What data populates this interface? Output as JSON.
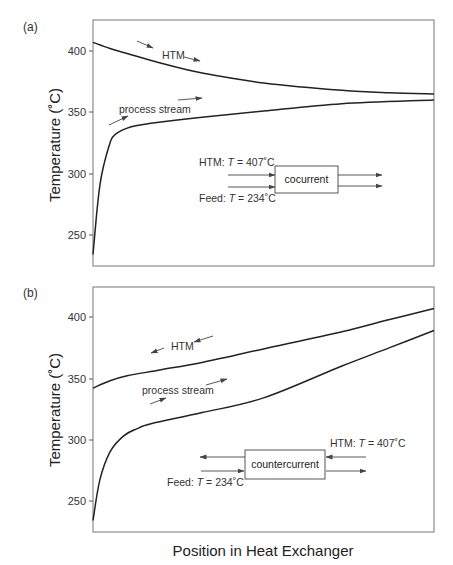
{
  "figure": {
    "xlabel": "Position in Heat Exchanger",
    "ylabel": "Temperature (°C)"
  },
  "chart_data": [
    {
      "type": "line",
      "panel": "(a)",
      "title": "",
      "xlabel": "",
      "ylabel": "Temperature (°C)",
      "ylim": [
        225,
        425
      ],
      "xlim": [
        0,
        1
      ],
      "yticks": [
        250,
        300,
        350,
        400
      ],
      "grid": false,
      "annotations": [
        "HTM",
        "process stream",
        "HTM: T = 407°C",
        "Feed: T = 234°C",
        "cocurrent"
      ],
      "series": [
        {
          "name": "HTM",
          "x": [
            0,
            0.05,
            0.1,
            0.2,
            0.32,
            0.5,
            0.73,
            0.87,
            1.0
          ],
          "y": [
            407,
            402,
            398,
            390,
            382,
            374,
            368,
            366,
            365
          ]
        },
        {
          "name": "process stream",
          "x": [
            0,
            0.01,
            0.02,
            0.03,
            0.05,
            0.065,
            0.11,
            0.17,
            0.32,
            0.5,
            0.73,
            1.0
          ],
          "y": [
            234,
            265,
            290,
            305,
            325,
            332,
            338,
            341,
            346,
            351,
            357,
            360
          ]
        }
      ]
    },
    {
      "type": "line",
      "panel": "(b)",
      "title": "",
      "xlabel": "Position in Heat Exchanger",
      "ylabel": "Temperature (°C)",
      "ylim": [
        225,
        425
      ],
      "xlim": [
        0,
        1
      ],
      "yticks": [
        250,
        300,
        350,
        400
      ],
      "grid": false,
      "annotations": [
        "HTM",
        "process stream",
        "HTM: T = 407°C",
        "Feed: T = 234°C",
        "countercurrent"
      ],
      "series": [
        {
          "name": "HTM",
          "x": [
            0,
            0.05,
            0.1,
            0.2,
            0.32,
            0.5,
            0.73,
            0.87,
            1.0
          ],
          "y": [
            342,
            348,
            352,
            357,
            363,
            374,
            388,
            398,
            407
          ]
        },
        {
          "name": "process stream",
          "x": [
            0,
            0.02,
            0.05,
            0.09,
            0.13,
            0.17,
            0.32,
            0.5,
            0.73,
            0.87,
            1.0
          ],
          "y": [
            234,
            267,
            290,
            303,
            309,
            313,
            322,
            334,
            360,
            375,
            389
          ]
        }
      ]
    }
  ],
  "panels": {
    "a": {
      "label": "(a)",
      "ticks": [
        "400",
        "350",
        "300",
        "250"
      ],
      "htm_label": "HTM",
      "process_label": "process stream",
      "inset": {
        "htm_in": "HTM: ",
        "htm_T": "T",
        "htm_val": " = 407˚C",
        "feed_in": "Feed: ",
        "feed_T": "T",
        "feed_val": " = 234˚C",
        "box_label": "cocurrent"
      }
    },
    "b": {
      "label": "(b)",
      "ticks": [
        "400",
        "350",
        "300",
        "250"
      ],
      "htm_label": "HTM",
      "process_label": "process stream",
      "inset": {
        "htm_in": "HTM: ",
        "htm_T": "T",
        "htm_val": " = 407˚C",
        "feed_in": "Feed: ",
        "feed_T": "T",
        "feed_val": " = 234˚C",
        "box_label": "countercurrent"
      }
    },
    "ylabel_a": "Temperature (˚C)",
    "ylabel_b": "Temperature (˚C)"
  }
}
